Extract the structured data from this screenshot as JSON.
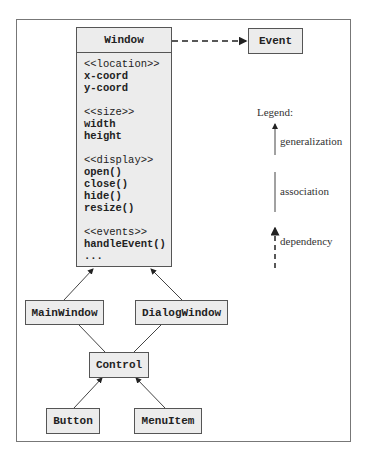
{
  "diagram": {
    "window_class": {
      "name": "Window",
      "groups": [
        {
          "stereotype": "<<location>>",
          "items": [
            "x-coord",
            "y-coord"
          ]
        },
        {
          "stereotype": "<<size>>",
          "items": [
            "width",
            "height"
          ]
        },
        {
          "stereotype": "<<display>>",
          "items": [
            "open()",
            "close()",
            "hide()",
            "resize()"
          ]
        },
        {
          "stereotype": "<<events>>",
          "items": [
            "handleEvent()",
            "..."
          ]
        }
      ]
    },
    "classes": {
      "event": "Event",
      "main_window": "MainWindow",
      "dialog_window": "DialogWindow",
      "control": "Control",
      "button": "Button",
      "menu_item": "MenuItem"
    },
    "relationships": [
      {
        "from": "Window",
        "to": "Event",
        "type": "dependency"
      },
      {
        "from": "MainWindow",
        "to": "Window",
        "type": "generalization"
      },
      {
        "from": "DialogWindow",
        "to": "Window",
        "type": "generalization"
      },
      {
        "from": "Control",
        "to": "MainWindow",
        "type": "association"
      },
      {
        "from": "Control",
        "to": "DialogWindow",
        "type": "association"
      },
      {
        "from": "Button",
        "to": "Control",
        "type": "generalization"
      },
      {
        "from": "MenuItem",
        "to": "Control",
        "type": "generalization"
      }
    ],
    "legend": {
      "title": "Legend:",
      "generalization": "generalization",
      "association": "association",
      "dependency": "dependency"
    }
  }
}
